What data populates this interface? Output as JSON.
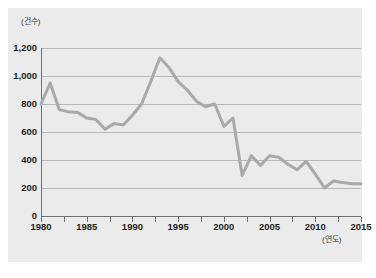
{
  "chart_data": {
    "type": "line",
    "title": "",
    "xlabel": "(연도)",
    "ylabel": "(건수)",
    "xlim": [
      1980,
      2015
    ],
    "ylim": [
      0,
      1200
    ],
    "grid": true,
    "legend": "none",
    "y_ticks": [
      "1,200",
      "1,000",
      "800",
      "600",
      "400",
      "200",
      "0"
    ],
    "y_tick_values": [
      1200,
      1000,
      800,
      600,
      400,
      200,
      0
    ],
    "x_ticks": [
      "1980",
      "1985",
      "1990",
      "1995",
      "2000",
      "2005",
      "2010",
      "2015"
    ],
    "x_tick_values": [
      1980,
      1985,
      1990,
      1995,
      2000,
      2005,
      2010,
      2015
    ],
    "x_minor_tick_values": [
      1980,
      1982.5,
      1985,
      1987.5,
      1990,
      1992.5,
      1995,
      1997.5,
      2000,
      2002.5,
      2005,
      2007.5,
      2010,
      2012.5,
      2015
    ],
    "line_color": "#a9a9a9",
    "grid_color": "#b9b9b9",
    "axis_color": "#6f6f6f",
    "plot_background": "#ebebeb",
    "page_background": "#ffffff",
    "series": [
      {
        "name": "건수",
        "x": [
          1980,
          1981,
          1982,
          1983,
          1984,
          1985,
          1986,
          1987,
          1988,
          1989,
          1990,
          1991,
          1992,
          1993,
          1994,
          1995,
          1996,
          1997,
          1998,
          1999,
          2000,
          2001,
          2002,
          2003,
          2004,
          2005,
          2006,
          2007,
          2008,
          2009,
          2010,
          2011,
          2012,
          2013,
          2014,
          2015
        ],
        "values": [
          800,
          950,
          760,
          745,
          740,
          700,
          690,
          620,
          660,
          650,
          720,
          800,
          960,
          1130,
          1060,
          960,
          900,
          820,
          780,
          800,
          640,
          700,
          290,
          430,
          360,
          430,
          420,
          370,
          330,
          390,
          300,
          200,
          250,
          240,
          230,
          230
        ]
      }
    ]
  }
}
